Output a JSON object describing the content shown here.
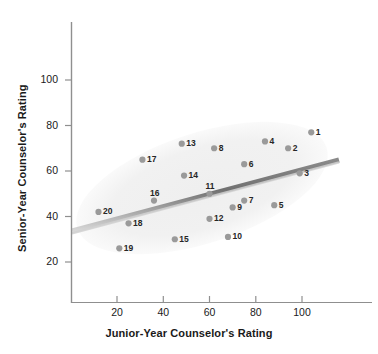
{
  "chart_data": {
    "type": "scatter",
    "title": "",
    "xlabel": "Junior-Year Counselor's Rating",
    "ylabel": "Senior-Year Counselor's Rating",
    "xlim": [
      0,
      115
    ],
    "ylim": [
      0,
      112
    ],
    "xticks": [
      20,
      40,
      60,
      80,
      100
    ],
    "yticks": [
      20,
      40,
      60,
      80,
      100
    ],
    "grid": false,
    "legend": "none",
    "point_color": "#9a9a9a",
    "label_color": "#262626",
    "axis_color": "#8c8c8c",
    "trendline_color": "#7d7d7d",
    "ellipse_color": "#f0f0f0",
    "annotations": {
      "trendline": {
        "description": "grey regression band",
        "x_start": 0,
        "y_start": 33,
        "x_end": 113,
        "y_end": 64
      },
      "ellipse": {
        "description": "light grey confidence ellipse enclosing the cloud",
        "center_x": 56,
        "center_y": 48,
        "rx": 57,
        "ry": 24,
        "rotation_deg": -18
      }
    },
    "points": [
      {
        "label": "1",
        "x": 104,
        "y": 77
      },
      {
        "label": "2",
        "x": 94,
        "y": 70
      },
      {
        "label": "3",
        "x": 99,
        "y": 59
      },
      {
        "label": "4",
        "x": 84,
        "y": 73
      },
      {
        "label": "5",
        "x": 88,
        "y": 45
      },
      {
        "label": "6",
        "x": 75,
        "y": 63
      },
      {
        "label": "7",
        "x": 75,
        "y": 47
      },
      {
        "label": "8",
        "x": 62,
        "y": 70
      },
      {
        "label": "9",
        "x": 70,
        "y": 44
      },
      {
        "label": "10",
        "x": 68,
        "y": 31
      },
      {
        "label": "11",
        "x": 60,
        "y": 50
      },
      {
        "label": "12",
        "x": 60,
        "y": 39
      },
      {
        "label": "13",
        "x": 48,
        "y": 72
      },
      {
        "label": "14",
        "x": 49,
        "y": 58
      },
      {
        "label": "15",
        "x": 45,
        "y": 30
      },
      {
        "label": "16",
        "x": 36,
        "y": 47
      },
      {
        "label": "17",
        "x": 31,
        "y": 65
      },
      {
        "label": "18",
        "x": 25,
        "y": 37
      },
      {
        "label": "19",
        "x": 21,
        "y": 26
      },
      {
        "label": "20",
        "x": 12,
        "y": 42
      }
    ]
  }
}
